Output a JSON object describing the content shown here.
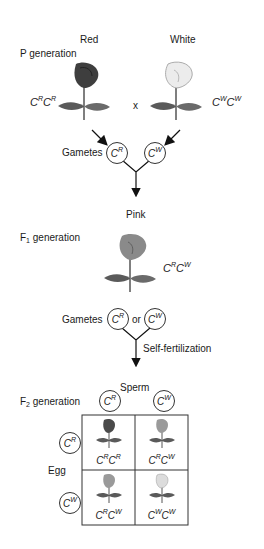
{
  "p_generation": {
    "label": "P generation",
    "parent_left": {
      "phenotype": "Red",
      "allele1": "C",
      "sup1": "R",
      "allele2": "C",
      "sup2": "R",
      "flower_color": "#3e3e3e"
    },
    "cross_symbol": "x",
    "parent_right": {
      "phenotype": "White",
      "allele1": "C",
      "sup1": "W",
      "allele2": "C",
      "sup2": "W",
      "flower_color": "#e8e8e8"
    },
    "gametes_label": "Gametes",
    "gamete_left": {
      "allele": "C",
      "sup": "R"
    },
    "gamete_right": {
      "allele": "C",
      "sup": "W"
    }
  },
  "f1_generation": {
    "label_prefix": "F",
    "label_sub": "1",
    "label_suffix": " generation",
    "phenotype": "Pink",
    "genotype": {
      "allele1": "C",
      "sup1": "R",
      "allele2": "C",
      "sup2": "W"
    },
    "flower_color": "#8a8a8a",
    "gametes_label": "Gametes",
    "or_label": "or",
    "gamete_left": {
      "allele": "C",
      "sup": "R"
    },
    "gamete_right": {
      "allele": "C",
      "sup": "W"
    },
    "process_label": "Self-fertilization"
  },
  "f2_generation": {
    "label_prefix": "F",
    "label_sub": "2",
    "label_suffix": " generation",
    "sperm_label": "Sperm",
    "egg_label": "Egg",
    "sperm": [
      {
        "allele": "C",
        "sup": "R"
      },
      {
        "allele": "C",
        "sup": "W"
      }
    ],
    "egg": [
      {
        "allele": "C",
        "sup": "R"
      },
      {
        "allele": "C",
        "sup": "W"
      }
    ],
    "cells": [
      {
        "allele1": "C",
        "sup1": "R",
        "allele2": "C",
        "sup2": "R",
        "flower_color": "#4a4a4a"
      },
      {
        "allele1": "C",
        "sup1": "R",
        "allele2": "C",
        "sup2": "W",
        "flower_color": "#9a9a9a"
      },
      {
        "allele1": "C",
        "sup1": "R",
        "allele2": "C",
        "sup2": "W",
        "flower_color": "#9a9a9a"
      },
      {
        "allele1": "C",
        "sup1": "W",
        "allele2": "C",
        "sup2": "W",
        "flower_color": "#dcdcdc"
      }
    ]
  }
}
